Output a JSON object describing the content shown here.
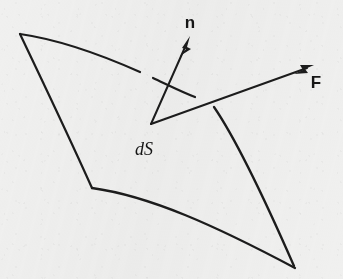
{
  "figure": {
    "kind": "vector-field-surface-element-diagram",
    "background_color": "#f0f0ef",
    "ink_color": "#1c1c1c",
    "width": 343,
    "height": 279,
    "labels": {
      "normal_vector": "n",
      "force_vector": "F",
      "surface_element": "dS"
    },
    "label_positions": {
      "normal_vector": {
        "x": 190,
        "y": 28
      },
      "force_vector": {
        "x": 316,
        "y": 88
      },
      "surface_element": {
        "x": 144,
        "y": 155
      }
    },
    "vector_origin": {
      "x": 151,
      "y": 124
    },
    "vectors": [
      {
        "name": "n",
        "label": "n",
        "description": "unit normal vector to the surface element",
        "tail": {
          "x": 151,
          "y": 124
        },
        "tip": {
          "x": 189,
          "y": 38
        },
        "stroke_width": 2.0,
        "arrowhead": "solid-filled",
        "crosses_surface_edge": true
      },
      {
        "name": "F",
        "label": "F",
        "description": "force (or flux) vector through the surface element",
        "tail": {
          "x": 151,
          "y": 124
        },
        "tip": {
          "x": 313,
          "y": 65
        },
        "stroke_width": 2.0,
        "arrowhead": "solid-filled",
        "crosses_surface_edge": true
      }
    ],
    "surface_patch": {
      "description": "curved quadrilateral surface element dS drawn in perspective",
      "stroke_width": 2.2,
      "corners": {
        "top_left": {
          "x": 20,
          "y": 34
        },
        "top_right": {
          "x": 206,
          "y": 100
        },
        "bottom_right": {
          "x": 295,
          "y": 268
        },
        "bottom_left": {
          "x": 92,
          "y": 188
        }
      },
      "edges": [
        {
          "name": "top-edge",
          "from": "top_left",
          "to": "top_right",
          "curvature": "bows-upward",
          "occluded_by": [
            "n",
            "F"
          ]
        },
        {
          "name": "right-edge",
          "from": "top_right",
          "to": "bottom_right",
          "curvature": "bows-right",
          "occluded_by": [
            "F"
          ]
        },
        {
          "name": "bottom-edge",
          "from": "bottom_right",
          "to": "bottom_left",
          "curvature": "bows-upward",
          "occluded_by": []
        },
        {
          "name": "left-edge",
          "from": "bottom_left",
          "to": "top_left",
          "curvature": "bows-left",
          "occluded_by": []
        }
      ]
    }
  }
}
